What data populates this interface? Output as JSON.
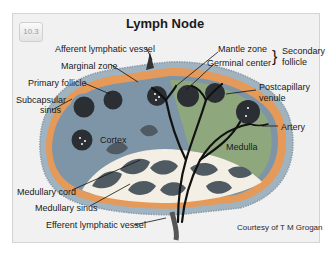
{
  "figure": {
    "badge": "10.3",
    "title": "Lymph Node",
    "credit": "Courtesy of T M Grogan"
  },
  "labels": {
    "afferent_vessel": "Afferent lymphatic vessel",
    "marginal_zone": "Marginal zone",
    "primary_follicle": "Primary follicle",
    "subcapsular_sinus_1": "Subcapsular",
    "subcapsular_sinus_2": "sinus",
    "cortex": "Cortex",
    "medullary_cord": "Medullary cord",
    "medullary_sinus": "Medullary sinus",
    "efferent_vessel": "Efferent lymphatic vessel",
    "mantle_zone": "Mantle zone",
    "germinal_center": "Germinal center",
    "secondary_follicle_1": "Secondary",
    "secondary_follicle_2": "follicle",
    "postcapillary_venule_1": "Postcapillary",
    "postcapillary_venule_2": "venule",
    "artery": "Artery",
    "medulla": "Medulla"
  },
  "colors": {
    "capsule": "#9fb3c0",
    "subcapsular_sinus": "#e59a5a",
    "cortex": "#7d95a6",
    "medulla": "#8fa77d",
    "follicle": "#2b2f34",
    "medullary_cord": "#4f5a63",
    "medullary_sinus": "#f4efe4",
    "vessels": "#111111"
  }
}
